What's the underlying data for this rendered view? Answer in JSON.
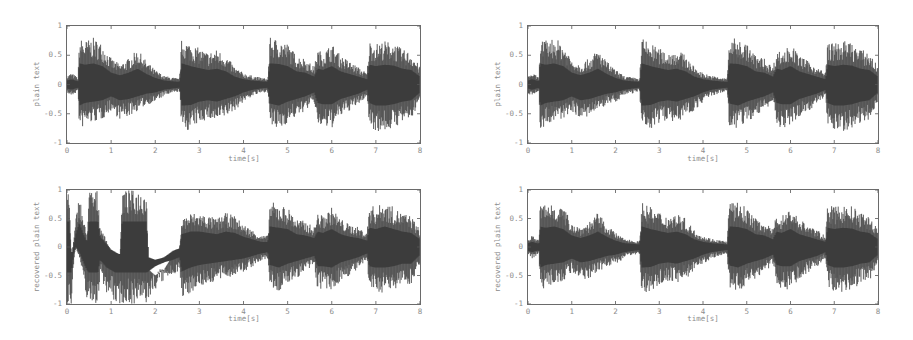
{
  "figure": {
    "panels": [
      {
        "id": "top-left",
        "ylabel": "plain text",
        "xlabel": "time[s]"
      },
      {
        "id": "bottom-left",
        "ylabel": "recovered plain text",
        "xlabel": "time[s]"
      },
      {
        "id": "top-right",
        "ylabel": "plain text",
        "xlabel": "time[s]"
      },
      {
        "id": "bottom-right",
        "ylabel": "recovered plain text",
        "xlabel": "time[s]"
      }
    ],
    "xticks": [
      "0",
      "1",
      "2",
      "3",
      "4",
      "5",
      "6",
      "7",
      "8"
    ],
    "yticks": [
      "1",
      "0.5",
      "0",
      "-0.5",
      "-1"
    ],
    "waveform_color": "#4a4a4a"
  },
  "chart_data": [
    {
      "type": "area",
      "title": "",
      "xlabel": "time[s]",
      "ylabel": "plain text",
      "xlim": [
        0,
        8
      ],
      "ylim": [
        -1,
        1
      ],
      "grid": false,
      "series": [
        {
          "name": "plain text envelope",
          "x": [
            0,
            0.1,
            0.25,
            0.28,
            0.4,
            0.6,
            0.8,
            1.0,
            1.2,
            1.4,
            1.6,
            1.8,
            2.0,
            2.2,
            2.4,
            2.55,
            2.6,
            2.8,
            3.0,
            3.2,
            3.4,
            3.6,
            3.8,
            4.0,
            4.2,
            4.4,
            4.55,
            4.6,
            4.8,
            5.0,
            5.2,
            5.4,
            5.6,
            5.68,
            5.8,
            6.0,
            6.2,
            6.4,
            6.6,
            6.8,
            6.85,
            7.0,
            7.2,
            7.4,
            7.6,
            7.8,
            8.0
          ],
          "upper": [
            0.15,
            0.2,
            0.12,
            0.8,
            0.75,
            0.8,
            0.7,
            0.45,
            0.35,
            0.45,
            0.6,
            0.4,
            0.25,
            0.15,
            0.12,
            0.1,
            0.8,
            0.7,
            0.62,
            0.55,
            0.6,
            0.5,
            0.3,
            0.2,
            0.15,
            0.12,
            0.1,
            0.8,
            0.78,
            0.7,
            0.5,
            0.45,
            0.3,
            0.6,
            0.55,
            0.7,
            0.5,
            0.4,
            0.3,
            0.2,
            0.75,
            0.7,
            0.75,
            0.72,
            0.6,
            0.55,
            0.3
          ],
          "lower": [
            -0.15,
            -0.2,
            -0.12,
            -0.8,
            -0.7,
            -0.65,
            -0.6,
            -0.45,
            -0.6,
            -0.55,
            -0.45,
            -0.35,
            -0.3,
            -0.2,
            -0.15,
            -0.12,
            -0.8,
            -0.78,
            -0.65,
            -0.6,
            -0.65,
            -0.55,
            -0.45,
            -0.3,
            -0.2,
            -0.15,
            -0.12,
            -0.72,
            -0.8,
            -0.65,
            -0.55,
            -0.45,
            -0.3,
            -0.7,
            -0.75,
            -0.75,
            -0.55,
            -0.45,
            -0.35,
            -0.2,
            -0.7,
            -0.8,
            -0.8,
            -0.75,
            -0.65,
            -0.6,
            -0.3
          ]
        }
      ]
    },
    {
      "type": "area",
      "title": "",
      "xlabel": "time[s]",
      "ylabel": "recovered plain text",
      "xlim": [
        0,
        8
      ],
      "ylim": [
        -1,
        1
      ],
      "grid": false,
      "series": [
        {
          "name": "recovered plain text envelope (corrupted first ~2.6 s)",
          "x": [
            0,
            0.05,
            0.1,
            0.15,
            0.2,
            0.28,
            0.35,
            0.45,
            0.5,
            0.55,
            0.7,
            0.75,
            0.9,
            1.0,
            1.1,
            1.2,
            1.25,
            1.3,
            1.5,
            1.8,
            1.85,
            2.0,
            2.2,
            2.4,
            2.55,
            2.6,
            2.8,
            3.0,
            3.2,
            3.4,
            3.6,
            3.8,
            4.0,
            4.2,
            4.4,
            4.55,
            4.6,
            4.8,
            5.0,
            5.2,
            5.4,
            5.6,
            5.68,
            5.8,
            6.0,
            6.2,
            6.4,
            6.6,
            6.8,
            6.85,
            7.0,
            7.2,
            7.4,
            7.6,
            7.8,
            8.0
          ],
          "upper": [
            1,
            1,
            -0.3,
            0.1,
            0.5,
            0.95,
            0.6,
            0.2,
            1,
            1,
            1,
            0.4,
            0.1,
            -0.1,
            -0.2,
            -0.3,
            1,
            1,
            1,
            1,
            -0.4,
            -0.5,
            -0.4,
            -0.15,
            -0.05,
            0.5,
            0.6,
            0.6,
            0.55,
            0.5,
            0.6,
            0.55,
            0.4,
            0.3,
            0.2,
            0.2,
            0.8,
            0.75,
            0.7,
            0.5,
            0.45,
            0.35,
            0.6,
            0.55,
            0.7,
            0.5,
            0.4,
            0.35,
            0.25,
            0.75,
            0.7,
            0.8,
            0.7,
            0.6,
            0.55,
            0.3
          ],
          "lower": [
            -1,
            -1,
            -1,
            -0.3,
            0,
            -0.2,
            -0.5,
            -0.9,
            -1,
            -1,
            -1,
            -0.5,
            -0.8,
            -0.9,
            -1,
            -1,
            -1,
            -1,
            -1,
            -1,
            -0.95,
            -0.75,
            -0.6,
            -0.5,
            -0.4,
            -0.95,
            -0.8,
            -0.7,
            -0.65,
            -0.6,
            -0.55,
            -0.5,
            -0.45,
            -0.35,
            -0.25,
            -0.2,
            -0.7,
            -0.8,
            -0.65,
            -0.55,
            -0.45,
            -0.35,
            -0.75,
            -0.75,
            -0.8,
            -0.6,
            -0.5,
            -0.4,
            -0.25,
            -0.75,
            -0.8,
            -0.8,
            -0.75,
            -0.65,
            -0.65,
            -0.3
          ]
        }
      ]
    },
    {
      "type": "area",
      "title": "",
      "xlabel": "time[s]",
      "ylabel": "plain text",
      "xlim": [
        0,
        8
      ],
      "ylim": [
        -1,
        1
      ],
      "grid": false,
      "series": [
        {
          "name": "plain text envelope",
          "x": [
            0,
            0.1,
            0.25,
            0.28,
            0.4,
            0.6,
            0.8,
            1.0,
            1.2,
            1.4,
            1.6,
            1.8,
            2.0,
            2.2,
            2.4,
            2.55,
            2.6,
            2.8,
            3.0,
            3.2,
            3.4,
            3.6,
            3.8,
            4.0,
            4.2,
            4.4,
            4.55,
            4.6,
            4.8,
            5.0,
            5.2,
            5.4,
            5.6,
            5.68,
            5.8,
            6.0,
            6.2,
            6.4,
            6.6,
            6.8,
            6.85,
            7.0,
            7.2,
            7.4,
            7.6,
            7.8,
            8.0
          ],
          "upper": [
            0.15,
            0.2,
            0.12,
            0.8,
            0.75,
            0.8,
            0.7,
            0.45,
            0.35,
            0.45,
            0.6,
            0.4,
            0.25,
            0.15,
            0.12,
            0.1,
            0.8,
            0.7,
            0.62,
            0.55,
            0.6,
            0.5,
            0.3,
            0.2,
            0.15,
            0.12,
            0.1,
            0.8,
            0.78,
            0.7,
            0.5,
            0.45,
            0.3,
            0.6,
            0.55,
            0.7,
            0.5,
            0.4,
            0.3,
            0.2,
            0.75,
            0.7,
            0.75,
            0.72,
            0.6,
            0.55,
            0.3
          ],
          "lower": [
            -0.15,
            -0.2,
            -0.12,
            -0.8,
            -0.7,
            -0.65,
            -0.6,
            -0.45,
            -0.6,
            -0.55,
            -0.45,
            -0.35,
            -0.3,
            -0.2,
            -0.15,
            -0.12,
            -0.8,
            -0.78,
            -0.65,
            -0.6,
            -0.65,
            -0.55,
            -0.45,
            -0.3,
            -0.2,
            -0.15,
            -0.12,
            -0.72,
            -0.8,
            -0.65,
            -0.55,
            -0.45,
            -0.3,
            -0.7,
            -0.75,
            -0.75,
            -0.55,
            -0.45,
            -0.35,
            -0.2,
            -0.7,
            -0.8,
            -0.8,
            -0.75,
            -0.65,
            -0.6,
            -0.3
          ]
        }
      ]
    },
    {
      "type": "area",
      "title": "",
      "xlabel": "time[s]",
      "ylabel": "recovered plain text",
      "xlim": [
        0,
        8
      ],
      "ylim": [
        -1,
        1
      ],
      "grid": false,
      "series": [
        {
          "name": "recovered plain text envelope (correct recovery)",
          "x": [
            0,
            0.1,
            0.25,
            0.28,
            0.4,
            0.6,
            0.8,
            1.0,
            1.2,
            1.4,
            1.6,
            1.8,
            2.0,
            2.2,
            2.4,
            2.55,
            2.6,
            2.8,
            3.0,
            3.2,
            3.4,
            3.6,
            3.8,
            4.0,
            4.2,
            4.4,
            4.55,
            4.6,
            4.8,
            5.0,
            5.2,
            5.4,
            5.6,
            5.68,
            5.8,
            6.0,
            6.2,
            6.4,
            6.6,
            6.8,
            6.85,
            7.0,
            7.2,
            7.4,
            7.6,
            7.8,
            8.0
          ],
          "upper": [
            0.15,
            0.2,
            0.12,
            0.8,
            0.75,
            0.8,
            0.7,
            0.45,
            0.35,
            0.45,
            0.6,
            0.4,
            0.25,
            0.15,
            0.12,
            0.1,
            0.8,
            0.7,
            0.62,
            0.55,
            0.6,
            0.5,
            0.3,
            0.2,
            0.15,
            0.12,
            0.1,
            0.8,
            0.78,
            0.7,
            0.5,
            0.45,
            0.3,
            0.6,
            0.55,
            0.7,
            0.5,
            0.4,
            0.3,
            0.2,
            0.75,
            0.7,
            0.75,
            0.72,
            0.6,
            0.55,
            0.3
          ],
          "lower": [
            -0.15,
            -0.2,
            -0.12,
            -0.8,
            -0.7,
            -0.65,
            -0.6,
            -0.45,
            -0.6,
            -0.55,
            -0.45,
            -0.35,
            -0.3,
            -0.2,
            -0.15,
            -0.12,
            -0.8,
            -0.78,
            -0.65,
            -0.6,
            -0.65,
            -0.55,
            -0.45,
            -0.3,
            -0.2,
            -0.15,
            -0.12,
            -0.72,
            -0.8,
            -0.65,
            -0.55,
            -0.45,
            -0.3,
            -0.7,
            -0.75,
            -0.75,
            -0.55,
            -0.45,
            -0.35,
            -0.2,
            -0.7,
            -0.8,
            -0.8,
            -0.75,
            -0.65,
            -0.6,
            -0.3
          ]
        }
      ]
    }
  ]
}
